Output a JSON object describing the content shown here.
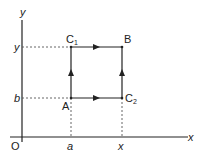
{
  "diagram": {
    "axes": {
      "x_label": "x",
      "y_label": "y",
      "origin_label": "O"
    },
    "ticks": {
      "x": [
        "a",
        "x"
      ],
      "y": [
        "b",
        "y"
      ]
    },
    "points": {
      "A": "A",
      "B": "B",
      "C1": "C",
      "C1_sub": "1",
      "C2": "C",
      "C2_sub": "2"
    },
    "paths": [
      {
        "from": "A",
        "to": "C2",
        "direction": "right"
      },
      {
        "from": "C2",
        "to": "B",
        "direction": "up"
      },
      {
        "from": "A",
        "to": "C1",
        "direction": "up"
      },
      {
        "from": "C1",
        "to": "B",
        "direction": "right"
      }
    ],
    "colors": {
      "line": "#222222",
      "dashed": "#555555"
    }
  }
}
